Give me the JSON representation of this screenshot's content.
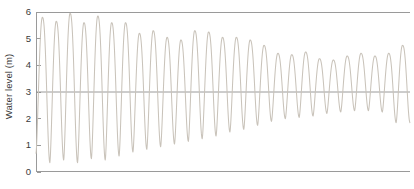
{
  "chart": {
    "ylabel": "Water level (m)",
    "xlabel": "",
    "title": "",
    "yticks": [
      "0",
      "1",
      "2",
      "3",
      "4",
      "5",
      "6"
    ],
    "line_color": "#c9c3ba",
    "axis_color": "#9a9a9a",
    "reference_line_color": "#8f8f8f"
  },
  "chart_data": {
    "type": "line",
    "title": "",
    "xlabel": "",
    "ylabel": "Water level (m)",
    "ylim": [
      0,
      6
    ],
    "xlim": [
      0,
      27
    ],
    "yticks": [
      0,
      1,
      2,
      3,
      4,
      5,
      6
    ],
    "xticks": [],
    "grid": false,
    "legend": null,
    "annotations": [
      {
        "type": "horizontal-reference-line",
        "y": 3,
        "label": ""
      }
    ],
    "mean_level": 3,
    "initial_amplitude": 2.8,
    "final_amplitude": 0.75,
    "cycles": 27,
    "series": [
      {
        "name": "Water level",
        "color": "#c9c3ba",
        "peaks": [
          5.8,
          5.65,
          5.95,
          5.6,
          5.85,
          5.6,
          5.6,
          5.2,
          5.3,
          5.05,
          4.95,
          5.3,
          5.25,
          5.05,
          5.05,
          4.95,
          4.75,
          4.45,
          4.4,
          4.5,
          4.25,
          4.2,
          4.35,
          4.45,
          4.35,
          4.45,
          4.75
        ],
        "troughs": [
          0.7,
          0.35,
          0.45,
          0.35,
          0.5,
          0.45,
          0.6,
          0.75,
          0.85,
          0.95,
          1.05,
          1.15,
          1.25,
          1.35,
          1.5,
          1.6,
          1.75,
          1.9,
          2.0,
          2.05,
          2.1,
          2.2,
          2.25,
          2.3,
          2.3,
          2.25,
          1.85
        ]
      }
    ]
  }
}
